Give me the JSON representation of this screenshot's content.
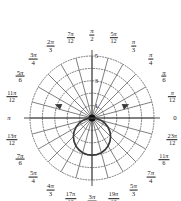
{
  "figure": {
    "kind": "polar-plot",
    "background": "#ffffff",
    "ink_color": "#1a1a1a",
    "grid_color": "#555555",
    "curve_color": "#3a3a3a",
    "center": {
      "x": 92,
      "y": 118
    },
    "pixel_radius": 62
  },
  "chart_data": {
    "type": "line",
    "title": "",
    "subtitle": "",
    "xlabel": "",
    "ylabel": "",
    "coordinate_system": "polar",
    "grid": true,
    "grid_style": "dotted",
    "legend": "none",
    "angle_unit": "radians",
    "angle_step_label": "pi/12",
    "angular_divisions": 24,
    "radial_circles": 5,
    "radial_max": 5,
    "radial_tick_values": [
      1,
      3,
      5
    ],
    "radial_tick_labels": [
      "1",
      "3",
      "5"
    ],
    "radial_tick_axis": "pi/2 (upward vertical)",
    "series": [
      {
        "name": "r = 3 sin(theta)",
        "equation_form": "r = 3 sin(theta)",
        "arrowheads": [
          "start",
          "end"
        ],
        "drawn_half": "lower",
        "theta": [
          3.14159,
          3.01069,
          2.87979,
          2.74889,
          2.61799,
          2.48709,
          2.35619,
          2.22529,
          2.0944,
          1.9635,
          1.8326,
          1.7017,
          1.5708,
          1.4399,
          1.309,
          1.1781,
          1.0472,
          0.9163,
          0.7854,
          0.6545,
          0.5236,
          0.3927,
          0.2618,
          0.1309,
          0.0
        ],
        "r": [
          0.0,
          0.391,
          0.776,
          1.148,
          1.5,
          1.827,
          2.121,
          2.379,
          2.598,
          2.772,
          2.898,
          2.974,
          3.0,
          2.974,
          2.898,
          2.772,
          2.598,
          2.379,
          2.121,
          1.827,
          1.5,
          1.148,
          0.776,
          0.391,
          0.0
        ],
        "reflected_below_axis": true
      }
    ],
    "angle_labels": [
      {
        "value": "0",
        "numerator": "0",
        "denominator": "",
        "radians": 0.0,
        "position": "right"
      },
      {
        "value": "pi/12",
        "numerator": "pi",
        "denominator": "12",
        "radians": 0.2618,
        "position": "right-upper"
      },
      {
        "value": "pi/6",
        "numerator": "pi",
        "denominator": "6",
        "radians": 0.5236,
        "position": "right-upper"
      },
      {
        "value": "pi/4",
        "numerator": "pi",
        "denominator": "4",
        "radians": 0.7854,
        "position": "upper-right"
      },
      {
        "value": "pi/3",
        "numerator": "pi",
        "denominator": "3",
        "radians": 1.0472,
        "position": "upper-right"
      },
      {
        "value": "5pi/12",
        "numerator": "5pi",
        "denominator": "12",
        "radians": 1.309,
        "position": "top-right"
      },
      {
        "value": "pi/2",
        "numerator": "pi",
        "denominator": "2",
        "radians": 1.5708,
        "position": "top"
      },
      {
        "value": "7pi/12",
        "numerator": "7pi",
        "denominator": "12",
        "radians": 1.8326,
        "position": "top-left"
      },
      {
        "value": "2pi/3",
        "numerator": "2pi",
        "denominator": "3",
        "radians": 2.0944,
        "position": "upper-left"
      },
      {
        "value": "3pi/4",
        "numerator": "3pi",
        "denominator": "4",
        "radians": 2.35619,
        "position": "upper-left"
      },
      {
        "value": "5pi/6",
        "numerator": "5pi",
        "denominator": "6",
        "radians": 2.61799,
        "position": "left-upper"
      },
      {
        "value": "11pi/12",
        "numerator": "11pi",
        "denominator": "12",
        "radians": 2.87979,
        "position": "left-upper"
      },
      {
        "value": "pi",
        "numerator": "pi",
        "denominator": "",
        "radians": 3.14159,
        "position": "left"
      },
      {
        "value": "13pi/12",
        "numerator": "13pi",
        "denominator": "12",
        "radians": 3.40339,
        "position": "left-lower"
      },
      {
        "value": "7pi/6",
        "numerator": "7pi",
        "denominator": "6",
        "radians": 3.66519,
        "position": "left-lower"
      },
      {
        "value": "5pi/4",
        "numerator": "5pi",
        "denominator": "4",
        "radians": 3.92699,
        "position": "lower-left"
      },
      {
        "value": "4pi/3",
        "numerator": "4pi",
        "denominator": "3",
        "radians": 4.18879,
        "position": "lower-left"
      },
      {
        "value": "17pi/12",
        "numerator": "17pi",
        "denominator": "12",
        "radians": 4.45059,
        "position": "bottom-left"
      },
      {
        "value": "3pi/2",
        "numerator": "3pi",
        "denominator": "2",
        "radians": 4.71239,
        "position": "bottom"
      },
      {
        "value": "19pi/12",
        "numerator": "19pi",
        "denominator": "12",
        "radians": 4.97419,
        "position": "bottom-right"
      },
      {
        "value": "5pi/3",
        "numerator": "5pi",
        "denominator": "3",
        "radians": 5.23599,
        "position": "lower-right"
      },
      {
        "value": "7pi/4",
        "numerator": "7pi",
        "denominator": "4",
        "radians": 5.49779,
        "position": "lower-right"
      },
      {
        "value": "11pi/6",
        "numerator": "11pi",
        "denominator": "6",
        "radians": 5.75959,
        "position": "right-lower"
      },
      {
        "value": "23pi/12",
        "numerator": "23pi",
        "denominator": "12",
        "radians": 6.02139,
        "position": "right-lower"
      }
    ]
  }
}
